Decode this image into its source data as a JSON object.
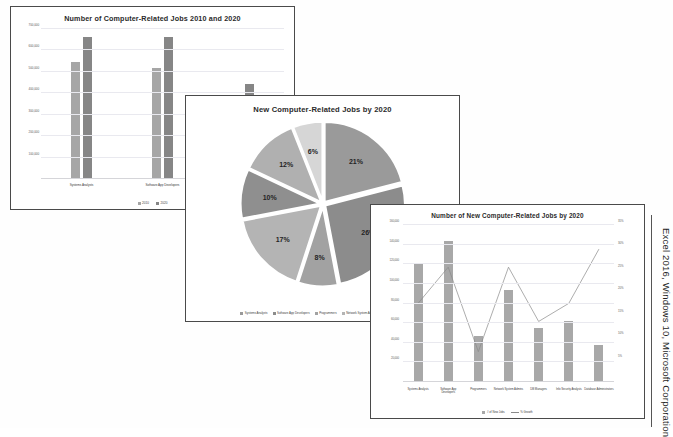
{
  "caption": "Excel 2016, Windows 10, Microsoft Corporation",
  "charts": [
    {
      "id": "chart-clustered-column",
      "chart_data": {
        "type": "bar",
        "title": "Number of Computer-Related Jobs 2010 and 2020",
        "categories": [
          "Systems Analysts",
          "Software App Developers",
          "Network Systems Admins"
        ],
        "series": [
          {
            "name": "2010",
            "values": [
              544000,
              520000,
              347000
            ],
            "color": "#a6a6a6"
          },
          {
            "name": "2020",
            "values": [
              664000,
              664000,
              443000
            ],
            "color": "#868686"
          }
        ],
        "xlabel": "",
        "ylabel": "",
        "ylim": [
          0,
          700000
        ],
        "yticks": [
          100000,
          200000,
          300000,
          400000,
          500000,
          600000,
          700000
        ],
        "ytick_labels": [
          "100,000",
          "200,000",
          "300,000",
          "400,000",
          "500,000",
          "600,000",
          "700,000"
        ],
        "grid": true,
        "legend_position": "bottom"
      }
    },
    {
      "id": "chart-pie",
      "chart_data": {
        "type": "pie",
        "title": "New Computer-Related Jobs by 2020",
        "labels": [
          "Systems Analysts",
          "Software App Developers",
          "Programmers",
          "Network System Admins",
          "DB Managers",
          "Info Security Analysts",
          "Database Administrators"
        ],
        "values": [
          21,
          26,
          8,
          17,
          10,
          12,
          6
        ],
        "value_labels": [
          "21%",
          "26%",
          "8%",
          "17%",
          "10%",
          "12%",
          "6%"
        ],
        "colors": [
          "#9a9a9a",
          "#8c8c8c",
          "#a2a2a2",
          "#b4b4b4",
          "#8f8f8f",
          "#b0b0b0",
          "#d6d6d6"
        ],
        "legend_position": "bottom",
        "exploded": true
      }
    },
    {
      "id": "chart-combo",
      "chart_data": {
        "type": "bar",
        "title": "Number of New Computer-Related Jobs by 2020",
        "categories": [
          "Systems Analysts",
          "Software App Developers",
          "Programmers",
          "Network System Admins",
          "DB Managers",
          "Info Security Analysts",
          "Database Administrators"
        ],
        "series": [
          {
            "name": "# of New Jobs",
            "type": "bar",
            "values": [
              120000,
              144000,
              47000,
              94000,
              55000,
              62000,
              38000
            ],
            "color": "#a8a8a8"
          },
          {
            "name": "% Growth",
            "type": "line",
            "values": [
              22,
              28,
              14,
              28,
              19,
              22,
              31
            ],
            "color": "#8a8a8a"
          }
        ],
        "ylim": [
          0,
          160000
        ],
        "yticks": [
          20000,
          40000,
          60000,
          80000,
          100000,
          120000,
          140000,
          160000
        ],
        "ytick_labels": [
          "20,000",
          "40,000",
          "60,000",
          "80,000",
          "100,000",
          "120,000",
          "140,000",
          "160,000"
        ],
        "y2lim": [
          0,
          35
        ],
        "y2ticks": [
          5,
          10,
          15,
          20,
          25,
          30,
          35
        ],
        "y2tick_labels": [
          "5%",
          "10%",
          "15%",
          "20%",
          "25%",
          "30%",
          "35%"
        ],
        "grid": true,
        "legend_position": "bottom"
      }
    }
  ]
}
